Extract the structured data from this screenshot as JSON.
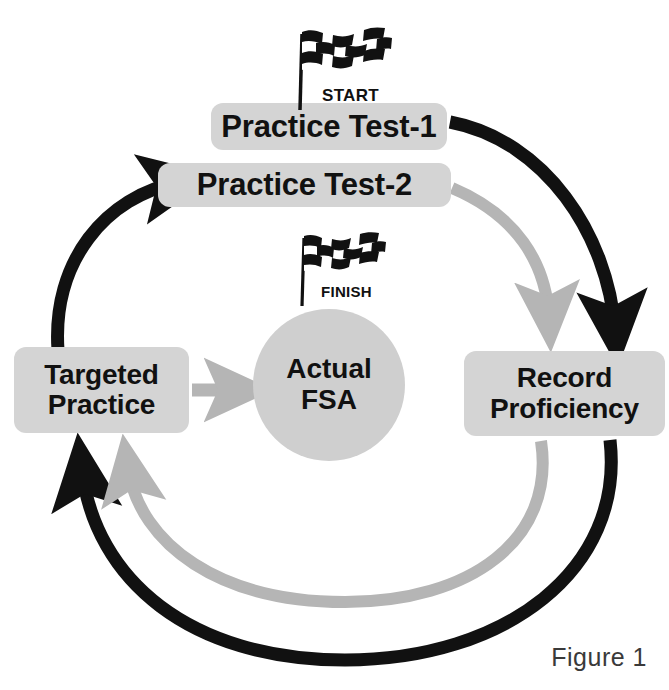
{
  "figure": {
    "caption": "Figure 1",
    "colors": {
      "node_fill": "#d4d4d4",
      "circle_fill": "#cfcfcf",
      "path_primary": "#111111",
      "path_secondary": "#b5b5b5",
      "text": "#111111",
      "background": "#ffffff"
    }
  },
  "nodes": {
    "practice_test_1": "Practice Test-1",
    "practice_test_2": "Practice Test-2",
    "targeted_practice_line1": "Targeted",
    "targeted_practice_line2": "Practice",
    "record_proficiency_line1": "Record",
    "record_proficiency_line2": "Proficiency",
    "actual_fsa_line1": "Actual",
    "actual_fsa_line2": "FSA"
  },
  "markers": {
    "start_label": "START",
    "finish_label": "FINISH",
    "start_icon": "checkered-flag-icon",
    "finish_icon": "checkered-flag-icon"
  },
  "flow": {
    "cycle_1_color": "#111111",
    "cycle_2_color": "#b5b5b5",
    "steps": [
      "Practice Test-1",
      "Record Proficiency",
      "Targeted Practice",
      "Practice Test-2",
      "Record Proficiency",
      "Targeted Practice",
      "Actual FSA"
    ]
  }
}
